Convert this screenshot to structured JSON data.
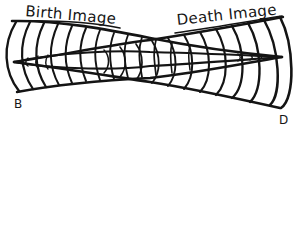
{
  "diagram": {
    "labels": {
      "birth_image": "Birth Image",
      "death_image": "Death Image",
      "point_b": "B",
      "point_d": "D"
    },
    "style": {
      "ink_color": "#141414",
      "background": "#ffffff"
    },
    "shapes": {
      "birth_cone": {
        "description": "funnel opening at left (B), narrowing to the right",
        "ribs": 11
      },
      "death_cone": {
        "description": "funnel narrowing at left, opening to the right (D)",
        "ribs": 11
      },
      "spindle": {
        "description": "horizontal lens-shaped axis through both cones"
      }
    }
  }
}
